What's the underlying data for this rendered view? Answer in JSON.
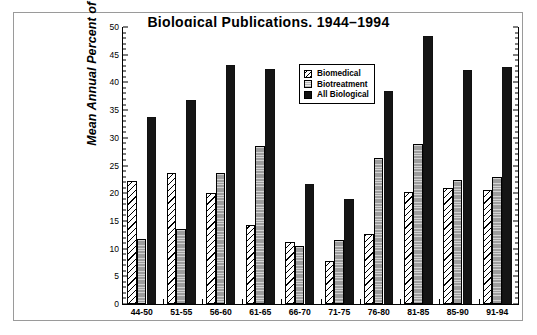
{
  "chart_data": {
    "type": "bar",
    "title": "Biological Publications, 1944–1994",
    "xlabel": "",
    "ylabel": "Mean Annual Percent of Reports",
    "ylim": [
      0,
      50
    ],
    "ytick_step": 5,
    "yticks": [
      0,
      5,
      10,
      15,
      20,
      25,
      30,
      35,
      40,
      45,
      50
    ],
    "ytick_labels": [
      "0",
      "5",
      "10",
      "15",
      "20",
      "25",
      "30",
      "35",
      "40",
      "45",
      "50"
    ],
    "grid": false,
    "legend_position": "upper center-right",
    "categories": [
      "44-50",
      "51-55",
      "56-60",
      "61-65",
      "66-70",
      "71-75",
      "76-80",
      "81-85",
      "85-90",
      "91-94"
    ],
    "series": [
      {
        "name": "Biomedical",
        "fill": "white-diagonal-hatch",
        "color": "#ffffff",
        "values": [
          22.2,
          23.6,
          20.0,
          14.3,
          11.2,
          7.8,
          12.7,
          20.2,
          21.0,
          20.5
        ]
      },
      {
        "name": "Biotreatment",
        "fill": "gray-horizontal-lines",
        "color": "#9d9d9d",
        "values": [
          11.8,
          13.5,
          23.7,
          28.6,
          10.5,
          11.6,
          26.3,
          28.8,
          22.3,
          22.9
        ]
      },
      {
        "name": "All Biological",
        "fill": "solid-black",
        "color": "#151515",
        "values": [
          33.7,
          36.9,
          43.2,
          42.5,
          21.7,
          19.0,
          38.4,
          48.4,
          42.2,
          42.8
        ]
      }
    ]
  },
  "legend": {
    "entries": [
      {
        "label": "Biomedical"
      },
      {
        "label": "Biotreatment"
      },
      {
        "label": "All Biological"
      }
    ]
  }
}
